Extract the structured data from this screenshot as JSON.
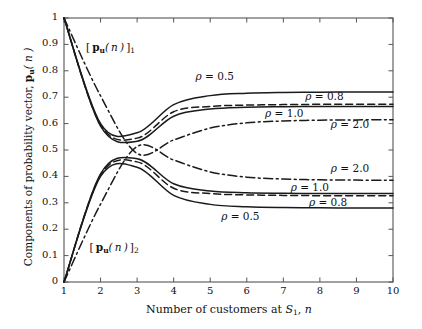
{
  "chart_data": {
    "type": "line",
    "title": "",
    "xlabel": "Number of customers at S1, n",
    "ylabel": "Components of probability vector, pu(n)",
    "xlim": [
      1,
      10
    ],
    "ylim": [
      0,
      1
    ],
    "grid": false,
    "legend_position": "inline-annotations",
    "xticks": [
      "1",
      "2",
      "3",
      "4",
      "5",
      "6",
      "7",
      "8",
      "9",
      "10"
    ],
    "yticks": [
      "0",
      "0.1",
      "0.2",
      "0.3",
      "0.4",
      "0.5",
      "0.6",
      "0.7",
      "0.8",
      "0.9",
      "1"
    ],
    "x": [
      1,
      2,
      3,
      4,
      5,
      6,
      7,
      8,
      9,
      10
    ],
    "series": [
      {
        "name": "rho = 0.5, component 1",
        "rho": 0.5,
        "component": 1,
        "style": "solid",
        "values": [
          1.0,
          0.6,
          0.565,
          0.672,
          0.706,
          0.715,
          0.718,
          0.719,
          0.72,
          0.72
        ]
      },
      {
        "name": "rho = 0.8, component 1",
        "rho": 0.8,
        "component": 1,
        "style": "dashed",
        "values": [
          1.0,
          0.595,
          0.545,
          0.645,
          0.665,
          0.67,
          0.672,
          0.673,
          0.673,
          0.673
        ]
      },
      {
        "name": "rho = 1.0, component 1",
        "rho": 1.0,
        "component": 1,
        "style": "solid",
        "values": [
          1.0,
          0.59,
          0.533,
          0.628,
          0.655,
          0.662,
          0.664,
          0.665,
          0.665,
          0.665
        ]
      },
      {
        "name": "rho = 2.0, component 1",
        "rho": 2.0,
        "component": 1,
        "style": "dashdot",
        "values": [
          1.0,
          0.705,
          0.487,
          0.538,
          0.583,
          0.603,
          0.61,
          0.613,
          0.614,
          0.615
        ]
      },
      {
        "name": "rho = 0.5, component 2",
        "rho": 0.5,
        "component": 2,
        "style": "solid",
        "values": [
          0.0,
          0.4,
          0.435,
          0.328,
          0.294,
          0.285,
          0.282,
          0.281,
          0.28,
          0.28
        ]
      },
      {
        "name": "rho = 0.8, component 2",
        "rho": 0.8,
        "component": 2,
        "style": "dashed",
        "values": [
          0.0,
          0.405,
          0.455,
          0.355,
          0.335,
          0.33,
          0.328,
          0.327,
          0.327,
          0.327
        ]
      },
      {
        "name": "rho = 1.0, component 2",
        "rho": 1.0,
        "component": 2,
        "style": "solid",
        "values": [
          0.0,
          0.41,
          0.467,
          0.372,
          0.345,
          0.338,
          0.336,
          0.335,
          0.335,
          0.335
        ]
      },
      {
        "name": "rho = 2.0, component 2",
        "rho": 2.0,
        "component": 2,
        "style": "dashdot",
        "values": [
          0.0,
          0.295,
          0.513,
          0.462,
          0.417,
          0.397,
          0.39,
          0.387,
          0.386,
          0.385
        ]
      }
    ],
    "annotations": [
      {
        "id": "upper-rho-05",
        "text": "ρ = 0.5",
        "x": 4.6,
        "y": 0.775
      },
      {
        "id": "upper-rho-08",
        "text": "ρ = 0.8",
        "x": 7.6,
        "y": 0.7
      },
      {
        "id": "upper-rho-10",
        "text": "ρ = 1.0",
        "x": 6.5,
        "y": 0.637
      },
      {
        "id": "upper-rho-20",
        "text": "ρ = 2.0",
        "x": 8.3,
        "y": 0.594
      },
      {
        "id": "lower-rho-20",
        "text": "ρ = 2.0",
        "x": 8.3,
        "y": 0.427
      },
      {
        "id": "lower-rho-10",
        "text": "ρ = 1.0",
        "x": 7.2,
        "y": 0.357
      },
      {
        "id": "lower-rho-08",
        "text": "ρ = 0.8",
        "x": 7.7,
        "y": 0.3
      },
      {
        "id": "lower-rho-05",
        "text": "ρ = 0.5",
        "x": 5.3,
        "y": 0.248
      },
      {
        "id": "vector-component-1",
        "text": "[ pu( n ) ]1",
        "x": 1.6,
        "y": 0.885
      },
      {
        "id": "vector-component-2",
        "text": "[ pu( n ) ]2",
        "x": 1.7,
        "y": 0.128
      }
    ]
  },
  "axes": {
    "x_label_text": "Number of customers at ",
    "x_label_sym": "S",
    "x_label_sub": "1",
    "x_label_tail": ", ",
    "x_label_n": "n",
    "y_label_text": "Components of probability vector, ",
    "y_label_p": "p",
    "y_label_psub": "u",
    "y_label_tail": "( n )"
  },
  "colors": {
    "line": "#1a1a1a",
    "axis": "#4d4d4d",
    "background": "#ffffff"
  }
}
